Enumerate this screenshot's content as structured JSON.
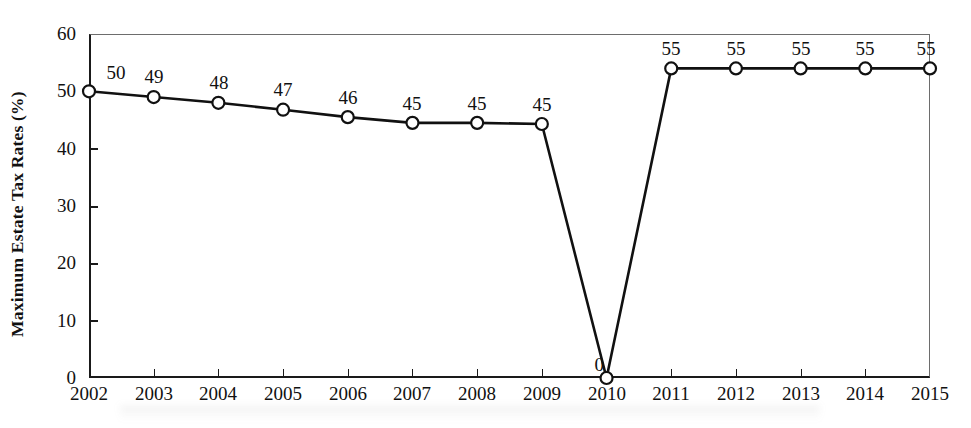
{
  "chart_data": {
    "type": "line",
    "title": "",
    "xlabel": "",
    "ylabel": "Maximum Estate Tax Rates (%)",
    "categories": [
      "2002",
      "2003",
      "2004",
      "2005",
      "2006",
      "2007",
      "2008",
      "2009",
      "2010",
      "2011",
      "2012",
      "2013",
      "2014",
      "2015"
    ],
    "values": [
      50,
      49,
      48,
      47,
      46,
      45,
      45,
      45,
      0,
      55,
      55,
      55,
      55,
      55
    ],
    "plotted_values": [
      50,
      49,
      48,
      46.8,
      45.5,
      44.5,
      44.5,
      44.3,
      0,
      54,
      54,
      54,
      54,
      54
    ],
    "data_labels": [
      "50",
      "49",
      "48",
      "47",
      "46",
      "45",
      "45",
      "45",
      "0",
      "55",
      "55",
      "55",
      "55",
      "55"
    ],
    "ylim": [
      0,
      60
    ],
    "yticks": [
      0,
      10,
      20,
      30,
      40,
      50,
      60
    ],
    "ytick_labels": [
      "0",
      "10",
      "20",
      "30",
      "40",
      "50",
      "60"
    ],
    "grid": false,
    "legend": null,
    "marker": "open-circle",
    "line_color": "#111111",
    "marker_fill": "#ffffff",
    "marker_stroke": "#111111"
  },
  "axes": {
    "y_title": "Maximum Estate Tax Rates (%)"
  }
}
